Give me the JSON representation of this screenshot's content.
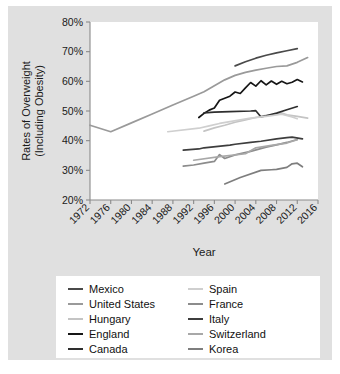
{
  "chart_data": {
    "type": "line",
    "title": "",
    "xlabel": "Year",
    "ylabel": "Rates of Overweight (Including Obesity)",
    "ylabel_line1": "Rates of Overweight",
    "ylabel_line2": "(Including Obesity)",
    "xlim": [
      1972,
      2016
    ],
    "ylim": [
      20,
      80
    ],
    "xticks": [
      1972,
      1976,
      1980,
      1984,
      1988,
      1992,
      1996,
      2000,
      2004,
      2008,
      2012,
      2016
    ],
    "xtick_labels": [
      "1972",
      "1976",
      "1980",
      "1984",
      "1988",
      "1992",
      "1996",
      "2000",
      "2004",
      "2008",
      "2012",
      "2016"
    ],
    "yticks": [
      20,
      30,
      40,
      50,
      60,
      70,
      80
    ],
    "ytick_labels": [
      "20%",
      "30%",
      "40%",
      "50%",
      "60%",
      "70%",
      "80%"
    ],
    "grid": false,
    "legend_position": "bottom",
    "series": [
      {
        "name": "Mexico",
        "color": "#4a4a4a",
        "x": [
          2000,
          2002,
          2004,
          2006,
          2008,
          2010,
          2012
        ],
        "y": [
          65.2,
          66.6,
          67.8,
          68.8,
          69.6,
          70.3,
          71.0
        ]
      },
      {
        "name": "United States",
        "color": "#9a9a9a",
        "x": [
          1972,
          1976,
          1980,
          1984,
          1988,
          1992,
          1994,
          1996,
          1998,
          2000,
          2002,
          2004,
          2006,
          2008,
          2010,
          2012,
          2014
        ],
        "y": [
          45.2,
          43.0,
          46.0,
          49.0,
          52.0,
          55.0,
          56.5,
          58.5,
          60.5,
          62.0,
          63.0,
          63.8,
          64.4,
          65.0,
          65.2,
          66.4,
          68.0
        ]
      },
      {
        "name": "Hungary",
        "color": "#c4c4c4",
        "x": [
          1994,
          1996,
          1998,
          2000,
          2002,
          2004,
          2006,
          2008,
          2009,
          2010,
          2012,
          2014
        ],
        "y": [
          43.2,
          44.3,
          45.2,
          46.2,
          47.0,
          47.8,
          48.5,
          49.0,
          49.3,
          48.7,
          48.2,
          47.6
        ]
      },
      {
        "name": "England",
        "color": "#161616",
        "x": [
          1993,
          1994,
          1995,
          1996,
          1997,
          1998,
          1999,
          2000,
          2001,
          2002,
          2003,
          2004,
          2005,
          2006,
          2007,
          2008,
          2009,
          2010,
          2011,
          2012,
          2013
        ],
        "y": [
          47.8,
          49.2,
          50.3,
          51.0,
          53.6,
          54.3,
          55.0,
          56.4,
          55.9,
          57.8,
          59.6,
          58.4,
          60.2,
          58.8,
          60.1,
          59.0,
          60.0,
          59.2,
          59.7,
          60.6,
          59.8
        ]
      },
      {
        "name": "Canada",
        "color": "#2e2e2e",
        "x": [
          1994,
          1996,
          1999,
          2003,
          2004,
          2005,
          2006,
          2008,
          2010,
          2012
        ],
        "y": [
          49.4,
          49.6,
          49.8,
          50.0,
          50.1,
          48.0,
          48.4,
          49.3,
          50.4,
          51.5
        ]
      },
      {
        "name": "Spain",
        "color": "#cfcfcf",
        "x": [
          1987,
          1993,
          1995,
          1997,
          2001,
          2003,
          2006,
          2009,
          2011,
          2012
        ],
        "y": [
          43.0,
          44.2,
          45.0,
          45.8,
          47.0,
          47.6,
          48.2,
          48.9,
          48.0,
          47.4
        ]
      },
      {
        "name": "France",
        "color": "#8c8c8c",
        "x": [
          1990,
          1992,
          1994,
          1996,
          1997,
          1998,
          2000,
          2003,
          2006,
          2008,
          2010,
          2012
        ],
        "y": [
          31.4,
          31.8,
          32.4,
          33.0,
          35.3,
          34.0,
          35.2,
          36.4,
          37.8,
          38.6,
          39.4,
          40.4
        ]
      },
      {
        "name": "Italy",
        "color": "#3d3d3d",
        "x": [
          1990,
          1993,
          1994,
          1999,
          2000,
          2003,
          2005,
          2008,
          2010,
          2011,
          2013
        ],
        "y": [
          36.8,
          37.2,
          37.6,
          38.5,
          38.8,
          39.4,
          39.8,
          40.6,
          41.0,
          41.2,
          40.6
        ]
      },
      {
        "name": "Switzerland",
        "color": "#a8a8a8",
        "x": [
          1992,
          1997,
          2002,
          2004,
          2007,
          2010,
          2012
        ],
        "y": [
          33.4,
          34.6,
          35.6,
          37.6,
          38.4,
          39.2,
          40.3
        ]
      },
      {
        "name": "Korea",
        "color": "#7e7e7e",
        "x": [
          1998,
          2001,
          2005,
          2007,
          2008,
          2010,
          2011,
          2012,
          2013
        ],
        "y": [
          25.4,
          27.6,
          30.0,
          30.2,
          30.3,
          31.0,
          32.2,
          32.4,
          31.2
        ]
      }
    ]
  },
  "legend": {
    "left_column": [
      {
        "label": "Mexico",
        "color": "#4a4a4a"
      },
      {
        "label": "United States",
        "color": "#9a9a9a"
      },
      {
        "label": "Hungary",
        "color": "#c4c4c4"
      },
      {
        "label": "England",
        "color": "#161616"
      },
      {
        "label": "Canada",
        "color": "#2e2e2e"
      }
    ],
    "right_column": [
      {
        "label": "Spain",
        "color": "#cfcfcf"
      },
      {
        "label": "France",
        "color": "#8c8c8c"
      },
      {
        "label": "Italy",
        "color": "#3d3d3d"
      },
      {
        "label": "Switzerland",
        "color": "#a8a8a8"
      },
      {
        "label": "Korea",
        "color": "#7e7e7e"
      }
    ]
  }
}
